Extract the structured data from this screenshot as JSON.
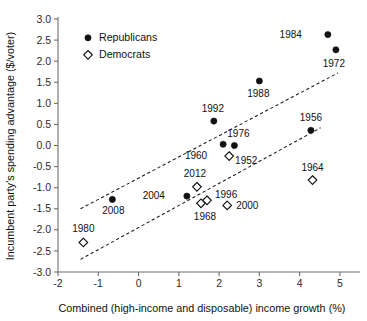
{
  "chart_data": {
    "type": "scatter",
    "title": "",
    "xlabel": "Combined (high-income and disposable) income growth (%)",
    "ylabel": "Incumbent party's spending advantage ($/voter)",
    "xlim": [
      -2,
      5.3
    ],
    "ylim": [
      -3.0,
      3.0
    ],
    "grid": false,
    "legend_position": "top-left",
    "xticks": [
      "-2",
      "-1",
      "0",
      "1",
      "2",
      "3",
      "4",
      "5"
    ],
    "xtick_values": [
      -2,
      -1,
      0,
      1,
      2,
      3,
      4,
      5
    ],
    "yticks": [
      "3.0",
      "2.5",
      "2.0",
      "1.5",
      "1.0",
      "0.5",
      "0.0",
      "-0.5",
      "-1.0",
      "-1.5",
      "-2.0",
      "-2.5",
      "-3.0"
    ],
    "ytick_values": [
      3.0,
      2.5,
      2.0,
      1.5,
      1.0,
      0.5,
      0.0,
      -0.5,
      -1.0,
      -1.5,
      -2.0,
      -2.5,
      -3.0
    ],
    "series": [
      {
        "name": "Republicans",
        "marker": "filled-circle",
        "color": "#111111",
        "points": [
          {
            "label": "1984",
            "x": 4.7,
            "y": 2.63,
            "label_dx": -26,
            "label_dy": 3
          },
          {
            "label": "1972",
            "x": 4.9,
            "y": 2.27,
            "label_dx": -2,
            "label_dy": 17
          },
          {
            "label": "1988",
            "x": 3.0,
            "y": 1.53,
            "label_dx": -1,
            "label_dy": 16
          },
          {
            "label": "1992",
            "x": 1.87,
            "y": 0.58,
            "label_dx": -1,
            "label_dy": -9
          },
          {
            "label": "1956",
            "x": 4.28,
            "y": 0.36,
            "label_dx": 0,
            "label_dy": -9
          },
          {
            "label": "1952",
            "x": 2.1,
            "y": 0.03,
            "label_dx": 12,
            "label_dy": 20
          },
          {
            "label": "1976",
            "x": 2.38,
            "y": 0.0,
            "label_dx": 4,
            "label_dy": -9
          },
          {
            "label": "2004",
            "x": 1.2,
            "y": -1.2,
            "label_dx": -22,
            "label_dy": 3
          },
          {
            "label": "2008",
            "x": -0.65,
            "y": -1.28,
            "label_dx": 1,
            "label_dy": 15
          }
        ]
      },
      {
        "name": "Democrats",
        "marker": "open-diamond",
        "color": "#ffffff",
        "points": [
          {
            "label": "1960",
            "x": 2.25,
            "y": -0.25,
            "label_dx": -22,
            "label_dy": 3
          },
          {
            "label": "1964",
            "x": 4.32,
            "y": -0.82,
            "label_dx": 0,
            "label_dy": -9
          },
          {
            "label": "2012",
            "x": 1.45,
            "y": -0.98,
            "label_dx": -2,
            "label_dy": -10
          },
          {
            "label": "1996",
            "x": 1.7,
            "y": -1.3,
            "label_dx": 8,
            "label_dy": -2
          },
          {
            "label": "1968",
            "x": 1.55,
            "y": -1.37,
            "label_dx": 4,
            "label_dy": 17
          },
          {
            "label": "2000",
            "x": 2.2,
            "y": -1.42,
            "label_dx": 9,
            "label_dy": 4
          },
          {
            "label": "1980",
            "x": -1.37,
            "y": -2.3,
            "label_dx": 0,
            "label_dy": -10
          }
        ]
      }
    ],
    "trendlines": [
      {
        "name": "upper-trendline",
        "x1": -1.44,
        "y1": -1.5,
        "x2": 4.95,
        "y2": 1.72,
        "style": "dashed"
      },
      {
        "name": "lower-trendline",
        "x1": -1.44,
        "y1": -2.7,
        "x2": 4.52,
        "y2": 0.42,
        "style": "dashed"
      }
    ]
  },
  "legend": {
    "items": [
      {
        "label": "Republicans",
        "marker": "filled-circle"
      },
      {
        "label": "Democrats",
        "marker": "open-diamond"
      }
    ]
  }
}
